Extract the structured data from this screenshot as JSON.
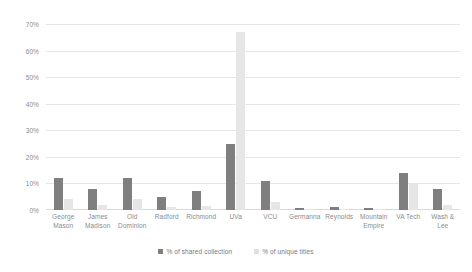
{
  "chart_data": {
    "type": "bar",
    "title": "",
    "xlabel": "",
    "ylabel": "",
    "ylim": [
      0,
      70
    ],
    "grid": true,
    "legend_position": "bottom-center",
    "ytick_labels": [
      "70%",
      "60%",
      "50%",
      "40%",
      "30%",
      "20%",
      "10%",
      "0%"
    ],
    "ytick_values": [
      70,
      60,
      50,
      40,
      30,
      20,
      10,
      0
    ],
    "categories": [
      "George Mason",
      "James Madison",
      "Old Dominion",
      "Radford",
      "Richmond",
      "UVa",
      "VCU",
      "Germanna",
      "Reynolds",
      "Mountain Empire",
      "VA Tech",
      "Wash & Lee"
    ],
    "series": [
      {
        "name": "% of shared collection",
        "color": "#7f7f7f",
        "values": [
          12,
          8,
          12,
          5,
          7,
          25,
          11,
          0.7,
          1,
          0.7,
          14,
          8
        ]
      },
      {
        "name": "% of unique titles",
        "color": "#e6e6e6",
        "values": [
          4,
          2,
          4,
          1,
          1.5,
          67,
          3,
          0.3,
          0.3,
          0.3,
          10,
          2
        ]
      }
    ]
  },
  "legend": {
    "items": [
      {
        "label": "% of shared collection",
        "swatch": "shared"
      },
      {
        "label": "% of unique titles",
        "swatch": "unique"
      }
    ]
  },
  "colors": {
    "shared": "#7f7f7f",
    "unique": "#e6e6e6",
    "gridline": "#e6e6e6",
    "tick_text": "#8a8a8a",
    "background": "#ffffff"
  }
}
